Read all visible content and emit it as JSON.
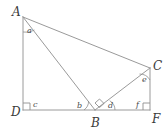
{
  "figure": {
    "type": "geometry-diagram",
    "background_color": "#ffffff",
    "line_color": "#9a9a9a",
    "label_color": "#3a3a3a",
    "vertices": [
      {
        "id": "A",
        "label": "A",
        "x": 23,
        "y": 17,
        "label_x": 12,
        "label_y": 16
      },
      {
        "id": "D",
        "label": "D",
        "x": 23,
        "y": 110,
        "label_x": 11,
        "label_y": 116
      },
      {
        "id": "B",
        "label": "B",
        "x": 95,
        "y": 110,
        "label_x": 91,
        "label_y": 127
      },
      {
        "id": "F",
        "label": "F",
        "x": 150,
        "y": 110,
        "label_x": 152,
        "label_y": 123
      },
      {
        "id": "C",
        "label": "C",
        "x": 150,
        "y": 68,
        "label_x": 153,
        "label_y": 70
      }
    ],
    "segments": [
      {
        "id": "AD",
        "from": "A",
        "to": "D"
      },
      {
        "id": "DF",
        "from": "D",
        "to": "F"
      },
      {
        "id": "CF",
        "from": "C",
        "to": "F"
      },
      {
        "id": "AC",
        "from": "A",
        "to": "C"
      },
      {
        "id": "AB",
        "from": "A",
        "to": "B"
      },
      {
        "id": "BC",
        "from": "B",
        "to": "C"
      }
    ],
    "angles": [
      {
        "id": "a",
        "label": "a",
        "at": "A",
        "between": "AD and AB",
        "label_x": 27,
        "label_y": 33,
        "marker": "arc"
      },
      {
        "id": "b",
        "label": "b",
        "at": "B",
        "between": "BD and BA",
        "label_x": 77,
        "label_y": 108,
        "marker": "arc"
      },
      {
        "id": "c",
        "label": "c",
        "at": "D",
        "between": "DA and DF",
        "label_x": 33,
        "label_y": 107,
        "marker": "right-angle"
      },
      {
        "id": "d",
        "label": "d",
        "at": "B",
        "between": "BC and BF",
        "label_x": 108,
        "label_y": 108,
        "marker": "arc"
      },
      {
        "id": "e",
        "label": "e",
        "at": "C",
        "between": "CB and CF",
        "label_x": 142,
        "label_y": 82,
        "marker": "arc"
      },
      {
        "id": "f",
        "label": "f",
        "at": "F",
        "between": "FD and FC",
        "label_x": 136,
        "label_y": 107,
        "marker": "right-angle"
      }
    ],
    "right_angle_markers": [
      {
        "id": "right-angle-D",
        "at": "D",
        "style": "square"
      },
      {
        "id": "right-angle-F",
        "at": "F",
        "style": "square"
      },
      {
        "id": "right-angle-B",
        "at": "B",
        "style": "rotated-square",
        "note": "angle ABC is a right angle"
      }
    ]
  }
}
